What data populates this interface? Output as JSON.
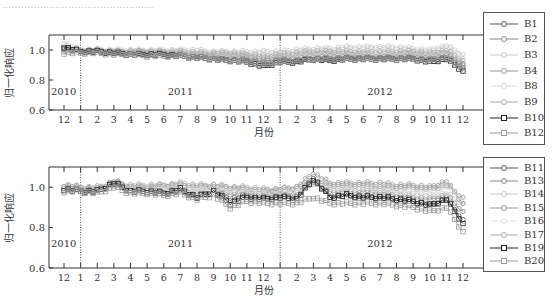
{
  "caption": "…………………………………………",
  "chart_data": [
    {
      "type": "line",
      "title": "",
      "xlabel": "月份",
      "ylabel": "归一化响应",
      "ylim": [
        0.6,
        1.1
      ],
      "yticks": [
        "0.6",
        "0.8",
        "1.0"
      ],
      "grid": false,
      "legend_position": "right",
      "x_ticks": [
        "12",
        "1",
        "2",
        "3",
        "4",
        "5",
        "6",
        "7",
        "8",
        "9",
        "10",
        "11",
        "12",
        "1",
        "2",
        "3",
        "4",
        "5",
        "6",
        "7",
        "8",
        "9",
        "10",
        "11",
        "12"
      ],
      "year_labels": [
        "2010",
        "2011",
        "2012"
      ],
      "categories": [
        "2010-12",
        "2011-01",
        "2011-02",
        "2011-03",
        "2011-04",
        "2011-05",
        "2011-06",
        "2011-07",
        "2011-08",
        "2011-09",
        "2011-10",
        "2011-11",
        "2011-12",
        "2012-01",
        "2012-02",
        "2012-03",
        "2012-04",
        "2012-05",
        "2012-06",
        "2012-07",
        "2012-08",
        "2012-09",
        "2012-10",
        "2012-11",
        "2012-12"
      ],
      "series": [
        {
          "name": "B1",
          "marker": "circle",
          "color": "#555555",
          "values": [
            1.02,
            0.99,
            0.99,
            0.98,
            0.98,
            0.98,
            0.97,
            0.97,
            0.96,
            0.95,
            0.94,
            0.93,
            0.91,
            0.93,
            0.93,
            0.94,
            0.94,
            0.95,
            0.95,
            0.95,
            0.95,
            0.95,
            0.94,
            0.95,
            0.88
          ]
        },
        {
          "name": "B2",
          "marker": "circle",
          "color": "#888888",
          "values": [
            1.01,
            0.99,
            1.0,
            0.99,
            0.99,
            0.99,
            0.98,
            0.98,
            0.97,
            0.97,
            0.96,
            0.96,
            0.94,
            0.95,
            0.96,
            0.97,
            0.97,
            0.97,
            0.97,
            0.96,
            0.97,
            0.97,
            0.96,
            0.98,
            0.91
          ]
        },
        {
          "name": "B3",
          "marker": "circle",
          "color": "#c8c8c8",
          "values": [
            1.05,
            1.0,
            1.0,
            1.0,
            1.0,
            1.0,
            1.0,
            1.0,
            1.0,
            0.99,
            0.99,
            0.99,
            0.99,
            0.99,
            1.0,
            1.01,
            1.01,
            1.02,
            1.02,
            1.02,
            1.02,
            1.01,
            1.0,
            1.03,
            0.97
          ]
        },
        {
          "name": "B4",
          "marker": "circle",
          "color": "#999999",
          "values": [
            1.0,
            0.99,
            0.99,
            0.99,
            0.98,
            0.98,
            0.98,
            0.97,
            0.97,
            0.96,
            0.96,
            0.95,
            0.93,
            0.94,
            0.95,
            0.96,
            0.96,
            0.96,
            0.96,
            0.96,
            0.96,
            0.96,
            0.95,
            0.97,
            0.9
          ]
        },
        {
          "name": "B8",
          "marker": "circle",
          "color": "#e0e0e0",
          "values": [
            0.99,
            0.99,
            0.99,
            0.98,
            0.98,
            0.98,
            0.98,
            0.98,
            0.97,
            0.97,
            0.97,
            0.97,
            0.96,
            0.97,
            0.97,
            0.98,
            0.98,
            0.98,
            0.98,
            0.98,
            0.98,
            0.98,
            0.97,
            0.99,
            0.95
          ]
        },
        {
          "name": "B9",
          "marker": "circle",
          "color": "#aaaaaa",
          "values": [
            1.0,
            1.0,
            1.0,
            0.99,
            0.99,
            0.99,
            0.99,
            0.99,
            0.98,
            0.98,
            0.98,
            0.97,
            0.96,
            0.97,
            0.98,
            0.99,
            0.99,
            0.99,
            0.99,
            0.99,
            0.99,
            0.99,
            0.98,
            1.0,
            0.93
          ]
        },
        {
          "name": "B10",
          "marker": "square",
          "color": "#222222",
          "values": [
            1.02,
            0.99,
            0.99,
            0.98,
            0.97,
            0.97,
            0.97,
            0.96,
            0.95,
            0.94,
            0.93,
            0.92,
            0.89,
            0.92,
            0.92,
            0.94,
            0.93,
            0.94,
            0.94,
            0.94,
            0.94,
            0.94,
            0.92,
            0.94,
            0.86
          ]
        },
        {
          "name": "B12",
          "marker": "square",
          "color": "#999999",
          "values": [
            0.98,
            0.98,
            0.98,
            0.97,
            0.97,
            0.96,
            0.96,
            0.96,
            0.95,
            0.94,
            0.93,
            0.92,
            0.9,
            0.92,
            0.93,
            0.94,
            0.94,
            0.94,
            0.94,
            0.94,
            0.94,
            0.94,
            0.93,
            0.95,
            0.88
          ]
        }
      ]
    },
    {
      "type": "line",
      "title": "",
      "xlabel": "月份",
      "ylabel": "归一化响应",
      "ylim": [
        0.6,
        1.1
      ],
      "yticks": [
        "0.6",
        "0.8",
        "1.0"
      ],
      "grid": false,
      "legend_position": "right",
      "x_ticks": [
        "12",
        "1",
        "2",
        "3",
        "4",
        "5",
        "6",
        "7",
        "8",
        "9",
        "10",
        "11",
        "12",
        "1",
        "2",
        "3",
        "4",
        "5",
        "6",
        "7",
        "8",
        "9",
        "10",
        "11",
        "12"
      ],
      "year_labels": [
        "2010",
        "2011",
        "2012"
      ],
      "categories": [
        "2010-12",
        "2011-01",
        "2011-02",
        "2011-03",
        "2011-04",
        "2011-05",
        "2011-06",
        "2011-07",
        "2011-08",
        "2011-09",
        "2011-10",
        "2011-11",
        "2011-12",
        "2012-01",
        "2012-02",
        "2012-03",
        "2012-04",
        "2012-05",
        "2012-06",
        "2012-07",
        "2012-08",
        "2012-09",
        "2012-10",
        "2012-11",
        "2012-12"
      ],
      "series": [
        {
          "name": "B11",
          "marker": "circle",
          "color": "#555555",
          "values": [
            1.0,
            0.99,
            0.98,
            1.02,
            0.99,
            0.99,
            0.97,
            0.98,
            0.95,
            0.98,
            0.94,
            0.96,
            0.95,
            0.96,
            0.95,
            1.05,
            0.95,
            0.96,
            0.95,
            0.95,
            0.94,
            0.93,
            0.91,
            0.94,
            0.84
          ]
        },
        {
          "name": "B13",
          "marker": "circle",
          "color": "#888888",
          "values": [
            1.01,
            1.0,
            0.99,
            1.03,
            1.0,
            1.0,
            0.98,
            0.99,
            0.97,
            0.99,
            0.97,
            0.97,
            0.96,
            0.97,
            0.97,
            1.02,
            0.98,
            0.98,
            0.98,
            0.97,
            0.96,
            0.95,
            0.94,
            0.96,
            0.88
          ]
        },
        {
          "name": "B14",
          "marker": "circle",
          "color": "#c8c8c8",
          "values": [
            1.0,
            0.99,
            0.99,
            1.02,
            1.0,
            1.0,
            0.99,
            0.99,
            0.98,
            0.99,
            0.98,
            0.98,
            0.97,
            0.97,
            0.98,
            1.03,
            0.99,
            0.99,
            0.99,
            0.98,
            0.98,
            0.97,
            0.96,
            0.97,
            0.92
          ]
        },
        {
          "name": "B15",
          "marker": "circle",
          "color": "#999999",
          "values": [
            1.0,
            0.99,
            0.99,
            1.02,
            1.0,
            1.0,
            1.01,
            1.01,
            1.0,
            1.01,
            1.0,
            0.99,
            0.98,
            0.99,
            1.0,
            1.07,
            1.02,
            1.02,
            1.02,
            1.02,
            1.01,
            1.01,
            1.0,
            1.03,
            0.92
          ]
        },
        {
          "name": "B16",
          "marker": "circle",
          "color": "#e0e0e0",
          "values": [
            1.0,
            1.0,
            1.0,
            1.01,
            1.0,
            1.0,
            1.0,
            1.0,
            0.99,
            1.0,
            0.99,
            0.99,
            0.98,
            0.98,
            0.99,
            1.02,
            1.0,
            1.0,
            1.0,
            1.0,
            0.99,
            0.99,
            0.98,
            1.0,
            0.95
          ]
        },
        {
          "name": "B17",
          "marker": "circle",
          "color": "#aaaaaa",
          "values": [
            1.01,
            1.0,
            1.0,
            1.02,
            1.01,
            1.01,
            1.01,
            1.02,
            1.01,
            1.01,
            1.0,
            1.0,
            0.99,
            0.99,
            1.0,
            1.03,
            1.01,
            1.01,
            1.01,
            1.0,
            1.0,
            1.0,
            0.99,
            1.01,
            0.95
          ]
        },
        {
          "name": "B19",
          "marker": "square",
          "color": "#222222",
          "values": [
            0.99,
            0.98,
            0.98,
            1.02,
            0.98,
            0.98,
            0.97,
            0.99,
            0.95,
            0.98,
            0.92,
            0.95,
            0.94,
            0.95,
            0.94,
            1.04,
            0.95,
            0.96,
            0.95,
            0.95,
            0.94,
            0.93,
            0.91,
            0.94,
            0.82
          ]
        },
        {
          "name": "B20",
          "marker": "square",
          "color": "#999999",
          "values": [
            0.98,
            0.98,
            0.97,
            1.0,
            0.97,
            0.97,
            0.96,
            0.97,
            0.94,
            0.96,
            0.9,
            0.93,
            0.92,
            0.92,
            0.92,
            0.95,
            0.92,
            0.92,
            0.92,
            0.92,
            0.91,
            0.9,
            0.88,
            0.9,
            0.78
          ]
        }
      ]
    }
  ]
}
